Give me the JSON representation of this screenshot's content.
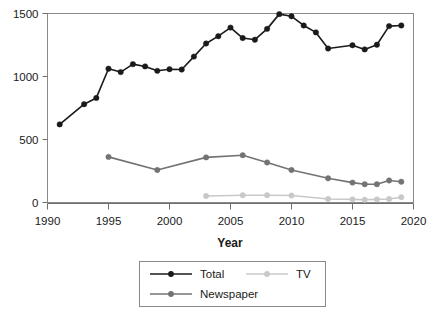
{
  "chart_data": {
    "type": "line",
    "title": "",
    "xlabel": "Year",
    "ylabel": "",
    "xlim": [
      1990,
      2020
    ],
    "ylim": [
      0,
      1500
    ],
    "xticks": [
      1990,
      1995,
      2000,
      2005,
      2010,
      2015,
      2020
    ],
    "xtick_labels": [
      "1990",
      "1995",
      "2000",
      "2005",
      "2010",
      "2015",
      "2020"
    ],
    "yticks": [
      0,
      500,
      1000,
      1500
    ],
    "ytick_labels": [
      "0",
      "500",
      "1000",
      "1500"
    ],
    "grid": false,
    "legend_position": "bottom-center",
    "series": [
      {
        "name": "Total",
        "color": "#1a1a1a",
        "marker": "circle",
        "x": [
          1991,
          1993,
          1994,
          1995,
          1996,
          1997,
          1998,
          1999,
          2000,
          2001,
          2002,
          2003,
          2004,
          2005,
          2006,
          2007,
          2008,
          2009,
          2010,
          2011,
          2012,
          2013,
          2015,
          2016,
          2017,
          2018,
          2019
        ],
        "values": [
          620,
          780,
          830,
          1062,
          1035,
          1098,
          1080,
          1045,
          1058,
          1055,
          1158,
          1262,
          1320,
          1388,
          1305,
          1292,
          1378,
          1495,
          1478,
          1405,
          1350,
          1222,
          1248,
          1215,
          1252,
          1400,
          1405
        ]
      },
      {
        "name": "Newspaper",
        "color": "#737373",
        "marker": "circle",
        "x": [
          1995,
          1999,
          2003,
          2006,
          2008,
          2010,
          2013,
          2015,
          2016,
          2017,
          2018,
          2019
        ],
        "values": [
          362,
          258,
          358,
          375,
          318,
          258,
          192,
          158,
          145,
          145,
          175,
          165
        ]
      },
      {
        "name": "TV",
        "color": "#c8c8c8",
        "marker": "circle",
        "x": [
          2003,
          2006,
          2008,
          2010,
          2013,
          2015,
          2016,
          2017,
          2018,
          2019
        ],
        "values": [
          52,
          58,
          58,
          55,
          28,
          25,
          22,
          25,
          28,
          42
        ]
      }
    ]
  },
  "axis": {
    "x_title": "Year",
    "x_tick_labels": [
      "1990",
      "1995",
      "2000",
      "2005",
      "2010",
      "2015",
      "2020"
    ],
    "y_tick_labels": [
      "1500",
      "1000",
      "500",
      "0"
    ]
  },
  "legend": {
    "entries": [
      {
        "label": "Total",
        "color": "#1a1a1a"
      },
      {
        "label": "Newspaper",
        "color": "#737373"
      },
      {
        "label": "TV",
        "color": "#c8c8c8"
      }
    ]
  }
}
